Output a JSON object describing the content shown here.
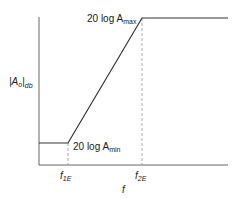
{
  "diagram": {
    "type": "bode-magnitude-asymptote",
    "y_axis_label": {
      "main": "|A",
      "sub": "o",
      "close": "|",
      "subscript": "db"
    },
    "x_axis_label": "f",
    "x_ticks": [
      {
        "main": "f",
        "sub": "1E"
      },
      {
        "main": "f",
        "sub": "2E"
      }
    ],
    "levels": {
      "max": {
        "prefix": "20 log A",
        "sub": "max"
      },
      "min": {
        "prefix": "20 log A",
        "sub": "min"
      }
    },
    "colors": {
      "line": "#333333",
      "dashed": "#888888",
      "axis": "#555555"
    }
  }
}
